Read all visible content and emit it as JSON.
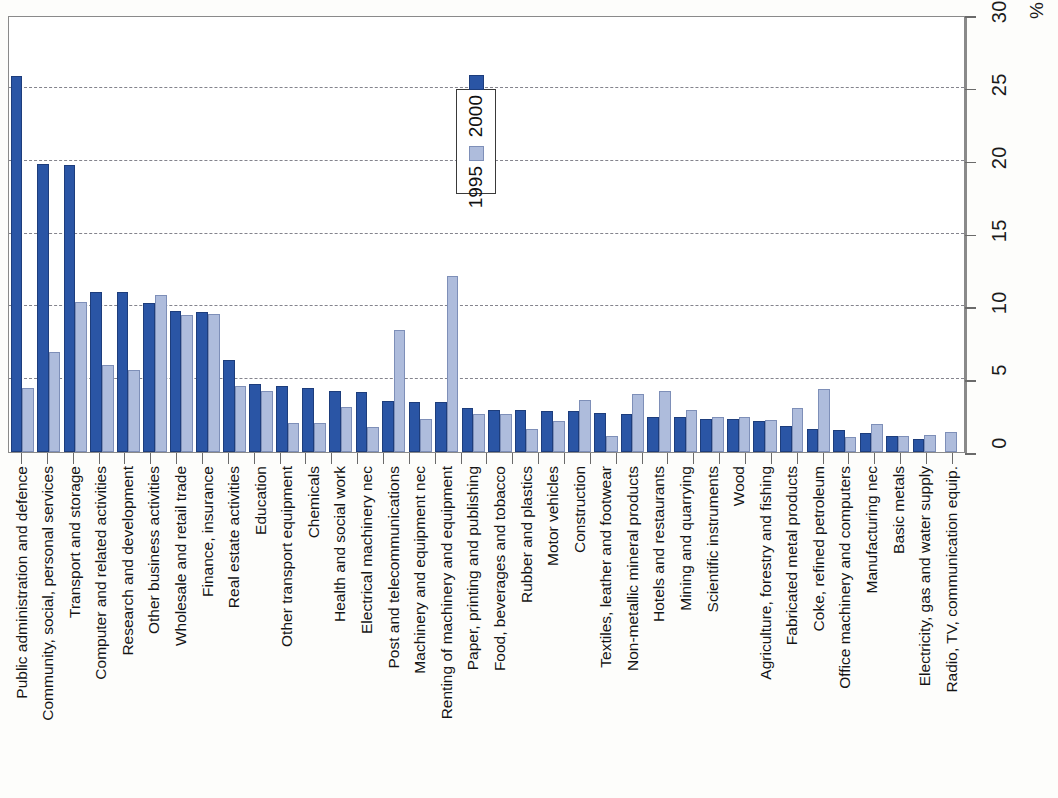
{
  "axis": {
    "unit_label": "%",
    "ticks": [
      "0",
      "5",
      "10",
      "15",
      "20",
      "25",
      "30"
    ],
    "min": 0,
    "max": 30
  },
  "legend": {
    "items": [
      {
        "label": "1995",
        "color": "#aebcdc"
      },
      {
        "label": "2000",
        "color": "#2a55a5"
      }
    ]
  },
  "chart_data": {
    "type": "bar",
    "title": "",
    "xlabel": "",
    "ylabel": "%",
    "ylim": [
      0,
      30
    ],
    "grid": true,
    "legend_position": "inside-top-center",
    "orientation": "vertical-rotated-labels",
    "categories": [
      "Public administration and defence",
      "Community, social, personal services",
      "Transport and storage",
      "Computer and related activities",
      "Research and development",
      "Other business activities",
      "Wholesale and retail trade",
      "Finance, insurance",
      "Real estate activities",
      "Education",
      "Other transport equipment",
      "Chemicals",
      "Health and social work",
      "Electrical machinery nec",
      "Post and telecommunications",
      "Machinery and equipment nec",
      "Renting of machinery and equipment",
      "Paper, printing and publishing",
      "Food, beverages and tobacco",
      "Rubber and plastics",
      "Motor vehicles",
      "Construction",
      "Textiles, leather and footwear",
      "Non-metallic mineral products",
      "Hotels and restaurants",
      "Mining and quarrying",
      "Scientific instruments",
      "Wood",
      "Agriculture, forestry and fishing",
      "Fabricated metal products",
      "Coke, refined petroleum",
      "Office machinery and computers",
      "Manufacturing nec",
      "Basic metals",
      "Electricity, gas and water supply",
      "Radio, TV, communication equip."
    ],
    "series": [
      {
        "name": "2000",
        "color": "#2a55a5",
        "values": [
          25.8,
          19.8,
          19.7,
          11.0,
          11.0,
          10.2,
          9.7,
          9.6,
          6.3,
          4.7,
          4.5,
          4.4,
          4.2,
          4.1,
          3.5,
          3.4,
          3.4,
          3.0,
          2.9,
          2.9,
          2.8,
          2.8,
          2.7,
          2.6,
          2.4,
          2.4,
          2.3,
          2.3,
          2.1,
          1.8,
          1.6,
          1.5,
          1.3,
          1.1,
          0.9,
          0.0
        ]
      },
      {
        "name": "1995",
        "color": "#aebcdc",
        "values": [
          4.4,
          6.9,
          10.3,
          6.0,
          5.6,
          10.8,
          9.4,
          9.5,
          4.5,
          4.2,
          2.0,
          2.0,
          3.1,
          1.7,
          8.4,
          2.3,
          12.1,
          2.6,
          2.6,
          1.6,
          2.1,
          3.6,
          1.1,
          4.0,
          4.2,
          2.9,
          2.4,
          2.4,
          2.2,
          3.0,
          4.3,
          1.0,
          1.9,
          1.1,
          1.2,
          1.4
        ]
      }
    ]
  }
}
